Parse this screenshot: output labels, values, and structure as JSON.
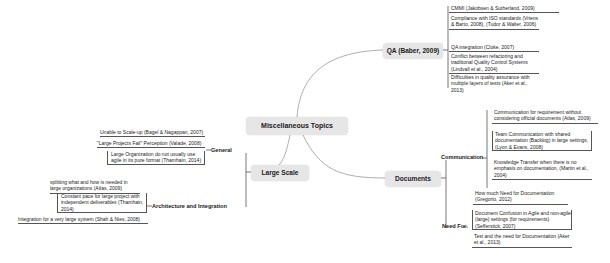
{
  "central": {
    "label": "Miscellaneous Topics"
  },
  "qa": {
    "label": "QA (Baber, 2009)",
    "items": [
      "CMMI (Jakobsen & Sutherland, 2009)",
      "Compliance with ISO standards (Vriens & Barto, 2008), (Tudor & Walter, 2006)",
      "QA integration (Cloke, 2007)",
      "Conflict between refactoring and traditional Quality Control Systems (Lindvall et al., 2004)",
      "Difficulties in quality assurance with multiple layers of tests (Aker et al., 2013)"
    ]
  },
  "large_scale": {
    "label": "Large Scale",
    "general": {
      "label": "General",
      "items": [
        "Unable to Scale-up (Bagel & Nagappan, 2007)",
        "\"Large Projects Fail\" Perception (Valade, 2008)",
        "Large Organization do not usually use agile in its pure format (Thamhain, 2014)"
      ]
    },
    "architecture": {
      "label": "Architecture and Integration",
      "items": [
        "splitting what and how is needed in large organizations (Atlas, 2009)",
        "Constant pace for large project with independent deliverables (Thamhain, 2014)",
        "Integration for a very large system (Shah & Nies, 2008)"
      ]
    }
  },
  "documents": {
    "label": "Documents",
    "communication": {
      "label": "Communication",
      "items": [
        "Communication for requirement without considering official documents (Atlas, 2009)",
        "Team Communication with shared documentation (Backlog) in large settings, (Lyon & Evans, 2008)",
        "Knowledge Transfer when there is no emphasis on documentation, (Martin et al., 2004)"
      ]
    },
    "need_for": {
      "label": "Need For",
      "items": [
        "How much Need for Documentation (Gregorio, 2012)",
        "Document Confusion in Agile and non-agile (large) settings (for requirements) (Sefferstick, 2007)",
        "Test and the need for Documentation (Aker et al., 2013)"
      ]
    }
  },
  "colors": {
    "node_fill": "#e6e6e6",
    "line": "#555555",
    "curve": "#9a9a9a",
    "background": "#ffffff"
  }
}
